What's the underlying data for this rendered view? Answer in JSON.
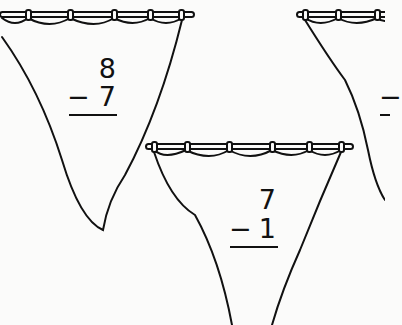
{
  "worksheet": {
    "problems": [
      {
        "top": "8",
        "operator": "−",
        "bottom": "7"
      },
      {
        "top": "7",
        "operator": "−",
        "bottom": "1"
      },
      {
        "top": "",
        "operator": "−",
        "bottom": ""
      }
    ]
  }
}
